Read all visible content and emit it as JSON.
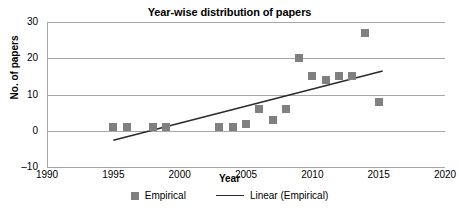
{
  "chart_data": {
    "type": "scatter",
    "title": "Year-wise distribution of papers",
    "xlabel": "Year",
    "ylabel": "No. of papers",
    "xlim": [
      1990,
      2020
    ],
    "ylim": [
      -10,
      30
    ],
    "xticks": [
      1990,
      1995,
      2000,
      2005,
      2010,
      2015,
      2020
    ],
    "yticks": [
      -10,
      0,
      10,
      20,
      30
    ],
    "grid": true,
    "legend_position": "bottom",
    "series": [
      {
        "name": "Empirical",
        "type": "scatter",
        "marker": "square",
        "color": "#808080",
        "x": [
          1995,
          1996,
          1998,
          1999,
          2003,
          2004,
          2005,
          2006,
          2007,
          2008,
          2009,
          2010,
          2011,
          2012,
          2013,
          2014,
          2015
        ],
        "values": [
          1,
          1,
          1,
          1,
          1,
          1,
          2,
          6,
          3,
          6,
          20,
          15,
          14,
          15,
          15,
          27,
          8
        ]
      },
      {
        "name": "Linear (Empirical)",
        "type": "line",
        "color": "#2b2b2b",
        "x": [
          1995,
          2015.3
        ],
        "values": [
          -2.6,
          16.5
        ]
      }
    ]
  },
  "legend": {
    "entries": [
      {
        "label": "Empirical",
        "symbol": "square-marker"
      },
      {
        "label": "Linear (Empirical)",
        "symbol": "line-segment"
      }
    ]
  },
  "colors": {
    "marker": "#808080",
    "trendline": "#2b2b2b",
    "gridline": "#a6a6a6",
    "text": "#000000",
    "background": "#ffffff"
  }
}
